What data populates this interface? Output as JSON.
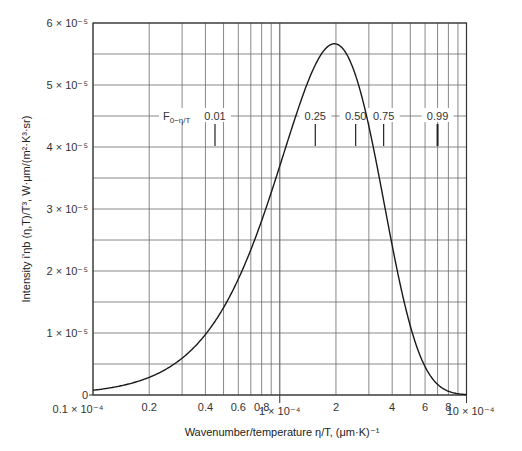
{
  "chart_data": {
    "type": "line",
    "title": "",
    "xlabel": "Wavenumber/temperature η/T, (μm·K)⁻¹",
    "ylabel": "Intensity i'ηb (η,T)/T³, W·μm/(m²·K³·sr)",
    "x_scale": "log",
    "xlim": [
      1e-05,
      0.001
    ],
    "ylim": [
      0,
      6e-05
    ],
    "grid": true,
    "x_tick_labels": [
      {
        "value": 0.1,
        "label": "0.1 × 10⁻⁴"
      },
      {
        "value": 0.2,
        "label": "0.2"
      },
      {
        "value": 0.4,
        "label": "0.4"
      },
      {
        "value": 0.6,
        "label": "0.6"
      },
      {
        "value": 0.8,
        "label": "0.8"
      },
      {
        "value": 1,
        "label": "1 × 10⁻⁴"
      },
      {
        "value": 2,
        "label": "2"
      },
      {
        "value": 4,
        "label": "4"
      },
      {
        "value": 6,
        "label": "6"
      },
      {
        "value": 8,
        "label": "8"
      },
      {
        "value": 10,
        "label": "10 × 10⁻⁴"
      }
    ],
    "y_tick_labels": [
      {
        "value": 0,
        "label": "0"
      },
      {
        "value": 1,
        "label": "1 × 10⁻⁵"
      },
      {
        "value": 2,
        "label": "2 × 10⁻⁵"
      },
      {
        "value": 3,
        "label": "3 × 10⁻⁵"
      },
      {
        "value": 4,
        "label": "4 × 10⁻⁵"
      },
      {
        "value": 5,
        "label": "5 × 10⁻⁵"
      },
      {
        "value": 6,
        "label": "6 × 10⁻⁵"
      }
    ],
    "x_units_note": "x values in units of 10⁻⁴ (μm·K)⁻¹",
    "y_units_note": "y values in units of 10⁻⁵",
    "series": [
      {
        "name": "Blackbody spectral intensity / T³",
        "x": [
          0.1,
          0.15,
          0.2,
          0.3,
          0.4,
          0.5,
          0.6,
          0.8,
          1.0,
          1.2,
          1.5,
          1.8,
          1.96,
          2.2,
          2.5,
          3.0,
          3.5,
          4.0,
          5.0,
          6.0,
          7.0,
          8.0,
          10.0
        ],
        "values": [
          0.077,
          0.17,
          0.3,
          0.63,
          0.98,
          1.35,
          1.72,
          2.44,
          3.14,
          3.8,
          4.63,
          5.44,
          5.66,
          5.6,
          5.27,
          4.42,
          3.42,
          2.55,
          1.24,
          0.54,
          0.22,
          0.08,
          0.01
        ]
      }
    ],
    "annotations": {
      "fraction_label": "F",
      "fraction_subscript": "0−η/T",
      "fractions": [
        {
          "label": "0.01",
          "x": 0.45
        },
        {
          "label": "0.25",
          "x": 1.55
        },
        {
          "label": "0.50",
          "x": 2.55
        },
        {
          "label": "0.75",
          "x": 3.6
        },
        {
          "label": "0.99",
          "x": 7.0
        }
      ]
    }
  },
  "axes": {
    "x_title": "Wavenumber/temperature η/T, (μm·K)⁻¹",
    "y_title": "Intensity i'ηb (η,T)/T³, W·μm/(m²·K³·sr)"
  }
}
